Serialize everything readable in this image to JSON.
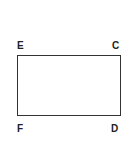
{
  "diagram": {
    "shape": "rectangle",
    "vertices": {
      "top_left": "E",
      "top_right": "C",
      "bottom_left": "F",
      "bottom_right": "D"
    },
    "colors": {
      "stroke": "#333333",
      "label": "#222222",
      "background": "#ffffff"
    }
  }
}
